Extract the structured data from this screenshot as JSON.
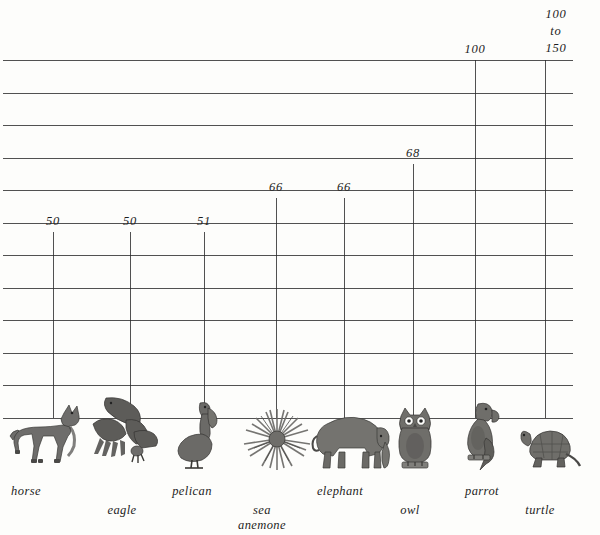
{
  "chart_data": {
    "type": "bar",
    "title": "",
    "xlabel": "",
    "ylabel": "",
    "ylim": [
      0,
      160
    ],
    "grid": true,
    "legend": false,
    "categories": [
      "horse",
      "eagle",
      "pelican",
      "sea anemone",
      "elephant",
      "owl",
      "parrot",
      "turtle"
    ],
    "values": [
      50,
      50,
      51,
      66,
      66,
      68,
      100,
      150
    ],
    "value_labels": [
      "50",
      "50",
      "51",
      "66",
      "66",
      "68",
      "100",
      "100 to 150"
    ],
    "annotations": [
      {
        "text": "100",
        "line": 1
      },
      {
        "text": "to",
        "line": 2
      },
      {
        "text": "150",
        "line": 3
      }
    ]
  },
  "grid": {
    "row_count": 11,
    "line_color": "#2b2b2b"
  },
  "columns": [
    {
      "id": "horse",
      "label": "horse",
      "value_label": "50",
      "x": 53,
      "bar_top": 232,
      "caption_x": 26,
      "caption_y": 484
    },
    {
      "id": "eagle",
      "label": "eagle",
      "value_label": "50",
      "x": 130,
      "bar_top": 232,
      "caption_x": 122,
      "caption_y": 503
    },
    {
      "id": "pelican",
      "label": "pelican",
      "value_label": "51",
      "x": 204,
      "bar_top": 232,
      "caption_x": 192,
      "caption_y": 484
    },
    {
      "id": "sea-anemone",
      "label": "sea",
      "label2": "anemone",
      "value_label": "66",
      "x": 276,
      "bar_top": 198,
      "caption_x": 262,
      "caption_y": 503
    },
    {
      "id": "elephant",
      "label": "elephant",
      "value_label": "66",
      "x": 344,
      "bar_top": 198,
      "caption_x": 340,
      "caption_y": 484
    },
    {
      "id": "owl",
      "label": "owl",
      "value_label": "68",
      "x": 413,
      "bar_top": 164,
      "caption_x": 410,
      "caption_y": 503
    },
    {
      "id": "parrot",
      "label": "parrot",
      "value_label": "100",
      "x": 475,
      "bar_top": 60,
      "caption_x": 482,
      "caption_y": 484
    },
    {
      "id": "turtle",
      "label": "turtle",
      "value_label": "",
      "x": 545,
      "bar_top": 60,
      "caption_x": 540,
      "caption_y": 503
    }
  ],
  "range_label": {
    "line1": "100",
    "line2": "to",
    "line3": "150"
  },
  "animals": [
    {
      "id": "horse",
      "name": "horse-illustration"
    },
    {
      "id": "eagle",
      "name": "eagle-illustration"
    },
    {
      "id": "pelican",
      "name": "pelican-illustration"
    },
    {
      "id": "sea-anemone",
      "name": "sea-anemone-illustration"
    },
    {
      "id": "elephant",
      "name": "elephant-illustration"
    },
    {
      "id": "owl",
      "name": "owl-illustration"
    },
    {
      "id": "parrot",
      "name": "parrot-illustration"
    },
    {
      "id": "turtle",
      "name": "turtle-illustration"
    }
  ]
}
